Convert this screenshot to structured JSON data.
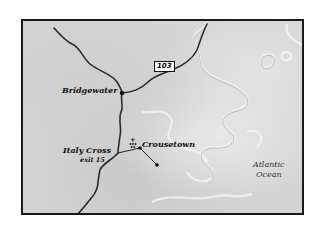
{
  "map": {
    "places": [
      {
        "name": "Bridgewater"
      },
      {
        "name": "Italy Cross",
        "sublabel": "exit 15"
      },
      {
        "name": "Crousetown"
      }
    ],
    "water": {
      "name_line1": "Atlantic",
      "name_line2": "Ocean"
    },
    "route_shield": "103",
    "colors": {
      "land": "#d4d4d4",
      "road": "#2a2a2a",
      "border": "#1a1a1a",
      "coast": "#eeeeee"
    }
  }
}
